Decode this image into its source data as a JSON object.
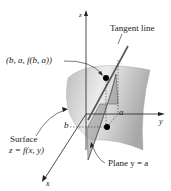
{
  "labels": {
    "z_axis": "z",
    "y_axis": "y",
    "x_axis": "x",
    "tangent_line": "Tangent line",
    "point": "(b, a, f(b, a))",
    "surface_line1": "Surface",
    "surface_line2": "z = f(x, y)",
    "plane": "Plane y = a",
    "b_mark": "b",
    "a_mark": "a"
  },
  "colors": {
    "surface_light": "#e6e6e6",
    "surface_dark": "#b4b4b4",
    "plane_fill": "#9a9a9a",
    "axis": "#222222",
    "point": "#000000"
  }
}
